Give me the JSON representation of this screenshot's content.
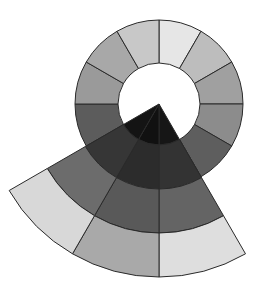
{
  "diagram": {
    "title": "",
    "ring": {
      "segment_count": 12,
      "segments": [
        {
          "position": "12-1",
          "color": "#e6e6e6"
        },
        {
          "position": "1-2",
          "color": "#bdbdbd"
        },
        {
          "position": "2-3",
          "color": "#a0a0a0"
        },
        {
          "position": "3-4",
          "color": "#8c8c8c"
        },
        {
          "position": "4-5",
          "color": "#5e5e5e"
        },
        {
          "position": "5-6",
          "color": "#4a4a4a"
        },
        {
          "position": "6-7",
          "color": "#4a4a4a"
        },
        {
          "position": "7-8",
          "color": "#4a4a4a"
        },
        {
          "position": "8-9",
          "color": "#5c5c5c"
        },
        {
          "position": "9-10",
          "color": "#9a9a9a"
        },
        {
          "position": "10-11",
          "color": "#a8a8a8"
        },
        {
          "position": "11-12",
          "color": "#c8c8c8"
        }
      ]
    },
    "wedge": {
      "start_position": 5,
      "segment_count": 3,
      "band_count": 4,
      "bands": [
        {
          "band": 1,
          "colors": [
            "#161616",
            "#111111",
            "#141414"
          ]
        },
        {
          "band": 2,
          "colors": [
            "#333333",
            "#2c2c2c",
            "#363636"
          ]
        },
        {
          "band": 3,
          "colors": [
            "#646464",
            "#595959",
            "#6c6c6c"
          ]
        },
        {
          "band": 4,
          "colors": [
            "#dedede",
            "#a9a9a9",
            "#d8d8d8"
          ]
        }
      ]
    }
  }
}
